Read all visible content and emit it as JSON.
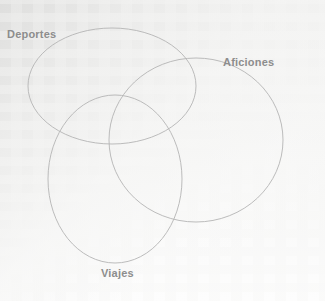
{
  "diagram": {
    "type": "venn",
    "title": "",
    "set_count": 3,
    "background_color": "#f2f2f1",
    "stroke_color": "#b4b4b4",
    "label_color": "#8d8d8d",
    "sets": [
      {
        "id": "deportes",
        "label": "Deportes",
        "shape": "ellipse",
        "cx": 112,
        "cy": 86,
        "rx": 84,
        "ry": 58,
        "rotation": 0,
        "label_position": "top-left"
      },
      {
        "id": "aficiones",
        "label": "Aficiones",
        "shape": "ellipse",
        "cx": 196,
        "cy": 140,
        "rx": 87,
        "ry": 82,
        "rotation": 0,
        "label_position": "top-right"
      },
      {
        "id": "viajes",
        "label": "Viajes",
        "shape": "ellipse",
        "cx": 115,
        "cy": 179,
        "rx": 67,
        "ry": 84,
        "rotation": 0,
        "label_position": "bottom"
      }
    ],
    "regions": []
  }
}
